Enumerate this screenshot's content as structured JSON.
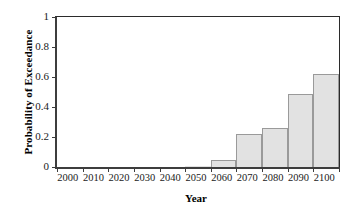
{
  "chart_data": {
    "type": "bar",
    "title": "",
    "xlabel": "Year",
    "ylabel": "Probability of Exceedance",
    "categories": [
      "2000",
      "2010",
      "2020",
      "2030",
      "2040",
      "2050",
      "2060",
      "2070",
      "2080",
      "2090",
      "2100"
    ],
    "values": [
      0,
      0,
      0,
      0,
      0,
      0.005,
      0.05,
      0.22,
      0.26,
      0.49,
      0.62
    ],
    "xlim": [
      2000,
      2110
    ],
    "ylim": [
      0,
      1
    ],
    "yticks": [
      "0",
      "0.2",
      "0.4",
      "0.6",
      "0.8",
      "1"
    ],
    "ytick_values": [
      0,
      0.2,
      0.4,
      0.6,
      0.8,
      1
    ],
    "xticks": [
      "2000",
      "2010",
      "2020",
      "2030",
      "2040",
      "2050",
      "2060",
      "2070",
      "2080",
      "2090",
      "2100"
    ],
    "grid": false,
    "legend": null,
    "bar_fill_color": "#e2e2e2",
    "bar_border_color": "#9a9a9a",
    "axis_color": "#3d3d3d"
  }
}
